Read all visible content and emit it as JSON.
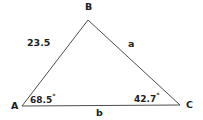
{
  "figure": {
    "type": "triangle-diagram",
    "background_color": "#ffffff",
    "line_color": "#4d4d4d",
    "text_color": "#1d1d1d",
    "width": 203,
    "height": 120
  },
  "vertices": [
    {
      "name": "A",
      "label": "A",
      "x": 22,
      "y": 106
    },
    {
      "name": "B",
      "label": "B",
      "x": 88,
      "y": 20
    },
    {
      "name": "C",
      "label": "C",
      "x": 180,
      "y": 105
    }
  ],
  "sides": [
    {
      "name": "AB",
      "label": "23.5",
      "from": "A",
      "to": "B"
    },
    {
      "name": "BC",
      "label": "a",
      "from": "B",
      "to": "C"
    },
    {
      "name": "AC",
      "label": "b",
      "from": "A",
      "to": "C"
    }
  ],
  "angles": [
    {
      "at": "A",
      "value": "68.5",
      "degree_symbol": "°",
      "label": "68.5°"
    },
    {
      "at": "C",
      "value": "42.7",
      "degree_symbol": "°",
      "label": "42.7°"
    }
  ],
  "labels": {
    "vertex_a": "A",
    "vertex_b": "B",
    "vertex_c": "C",
    "side_ab": "23.5",
    "side_bc": "a",
    "side_ac": "b",
    "angle_a_value": "68.5",
    "angle_c_value": "42.7",
    "degree": "°"
  },
  "chart_data": {
    "type": "diagram",
    "title": "",
    "shape": "triangle",
    "points": {
      "A": [
        22,
        106
      ],
      "B": [
        88,
        20
      ],
      "C": [
        180,
        105
      ]
    },
    "edge_labels": {
      "AB": "23.5",
      "BC": "a",
      "AC": "b"
    },
    "angle_labels": {
      "A": "68.5°",
      "C": "42.7°"
    }
  }
}
